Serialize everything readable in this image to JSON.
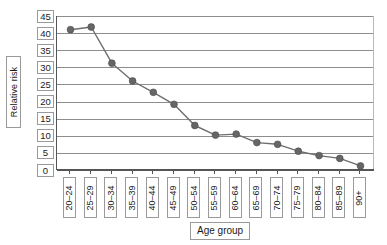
{
  "chart_data": {
    "type": "line",
    "title": "",
    "xlabel": "Age group",
    "ylabel": "Relative risk",
    "ylim": [
      0,
      45
    ],
    "ytick_step": 5,
    "yticks": [
      "45",
      "40",
      "35",
      "30",
      "25",
      "20",
      "15",
      "10",
      "5",
      "0"
    ],
    "grid": true,
    "legend": "none",
    "categories": [
      "20–24",
      "25–29",
      "30–34",
      "35–39",
      "40–44",
      "45–49",
      "50–54",
      "55–59",
      "60–64",
      "65–69",
      "70–74",
      "75–79",
      "80–84",
      "85–89",
      "90+"
    ],
    "values": [
      41.0,
      41.8,
      31.2,
      26.0,
      22.7,
      19.2,
      13.0,
      10.2,
      10.5,
      8.0,
      7.5,
      5.5,
      4.2,
      3.4,
      1.2
    ],
    "series": [
      {
        "name": "Relative risk",
        "values": [
          41.0,
          41.8,
          31.2,
          26.0,
          22.7,
          19.2,
          13.0,
          10.2,
          10.5,
          8.0,
          7.5,
          5.5,
          4.2,
          3.4,
          1.2
        ]
      }
    ]
  },
  "colors": {
    "marker": "#666666",
    "line": "#6e6e6e",
    "grid": "#8d8d8d",
    "axis": "#555555",
    "box_border": "#9a9a9a",
    "background": "#ffffff"
  }
}
